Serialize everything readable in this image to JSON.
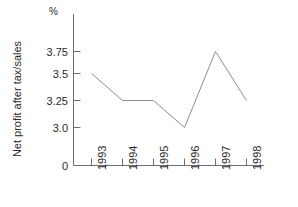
{
  "chart_data": {
    "type": "line",
    "title": "",
    "subtitle": "",
    "xlabel": "",
    "ylabel": "Net profit after tax/sales",
    "unit_label": "%",
    "categories": [
      "1993",
      "1994",
      "1995",
      "1996",
      "1997",
      "1998"
    ],
    "values": [
      3.5,
      3.25,
      3.25,
      3.0,
      3.75,
      3.25
    ],
    "series": [
      {
        "name": "Net profit after tax/sales",
        "values": [
          3.5,
          3.25,
          3.25,
          3.0,
          3.75,
          3.25
        ]
      }
    ],
    "ytick_labels": [
      "3.75",
      "3.5",
      "3.25",
      "3.0",
      "0"
    ],
    "ytick_values": [
      3.75,
      3.5,
      3.25,
      3.0,
      0
    ],
    "ylim": [
      0,
      3.9
    ],
    "axis_break": true,
    "grid": false,
    "legend": false,
    "legend_position": "none",
    "line_color": "#8c8c8c",
    "axis_color": "#6e6e6e",
    "background_color": "#ffffff",
    "text_color": "#2b2b2b"
  },
  "axes": {
    "y_title": "Net profit after tax/sales",
    "y_unit": "%",
    "y_ticks": [
      {
        "label": "3.75",
        "value": 3.75
      },
      {
        "label": "3.5",
        "value": 3.5
      },
      {
        "label": "3.25",
        "value": 3.25
      },
      {
        "label": "3.0",
        "value": 3.0
      },
      {
        "label": "0",
        "value": 0
      }
    ],
    "x_ticks": [
      {
        "label": "1993"
      },
      {
        "label": "1994"
      },
      {
        "label": "1995"
      },
      {
        "label": "1996"
      },
      {
        "label": "1997"
      },
      {
        "label": "1998"
      }
    ]
  }
}
